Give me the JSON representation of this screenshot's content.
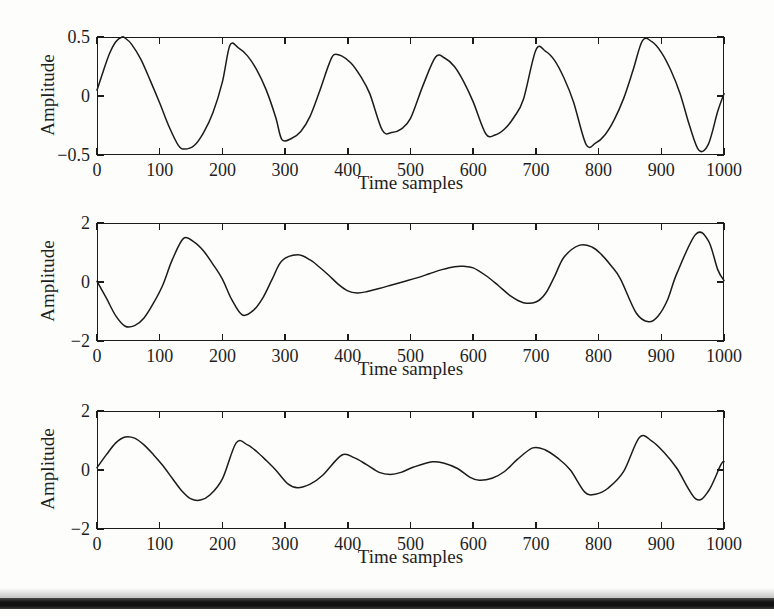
{
  "figure": {
    "background_color": "#fdfdfc",
    "line_color": "#1b1b1b",
    "panel_count": 3
  },
  "axis_labels": {
    "xlabel": "Time samples",
    "ylabel": "Amplitude"
  },
  "xticks": [
    "0",
    "100",
    "200",
    "300",
    "400",
    "500",
    "600",
    "700",
    "800",
    "900",
    "1000"
  ],
  "panels": [
    {
      "name": "panel-top",
      "ylabel": "Amplitude",
      "xlabel": "Time samples",
      "yticks": [
        "0.5",
        "0",
        "-0.5"
      ]
    },
    {
      "name": "panel-middle",
      "ylabel": "Amplitude",
      "xlabel": "Time samples",
      "yticks": [
        "2",
        "0",
        "-2"
      ]
    },
    {
      "name": "panel-bottom",
      "ylabel": "Amplitude",
      "xlabel": "Time samples",
      "yticks": [
        "2",
        "0",
        "-2"
      ]
    }
  ],
  "chart_data": [
    {
      "type": "line",
      "title": "",
      "xlabel": "Time samples",
      "ylabel": "Amplitude",
      "xlim": [
        0,
        1000
      ],
      "ylim": [
        -0.5,
        0.5
      ],
      "xticks": [
        0,
        100,
        200,
        300,
        400,
        500,
        600,
        700,
        800,
        900,
        1000
      ],
      "yticks": [
        -0.5,
        0,
        0.5
      ],
      "grid": false,
      "legend": "none",
      "series": [
        {
          "name": "signal-1",
          "description": "Near-sinusoidal carrier, about 6 cycles over 1000 samples, peak magnitude varying between roughly 0.30 and 0.50",
          "x": [
            0,
            10,
            20,
            30,
            40,
            45,
            55,
            70,
            85,
            100,
            115,
            130,
            140,
            155,
            170,
            185,
            200,
            212,
            225,
            240,
            255,
            270,
            285,
            295,
            310,
            325,
            340,
            355,
            370,
            378,
            390,
            405,
            420,
            435,
            455,
            470,
            485,
            500,
            520,
            540,
            555,
            570,
            585,
            600,
            620,
            635,
            650,
            665,
            680,
            700,
            715,
            730,
            745,
            760,
            780,
            795,
            810,
            825,
            840,
            855,
            870,
            885,
            900,
            915,
            930,
            945,
            960,
            975,
            990,
            1000
          ],
          "y": [
            0.05,
            0.21,
            0.36,
            0.46,
            0.5,
            0.49,
            0.44,
            0.31,
            0.13,
            -0.06,
            -0.26,
            -0.42,
            -0.45,
            -0.42,
            -0.31,
            -0.14,
            0.12,
            0.43,
            0.41,
            0.34,
            0.22,
            0.05,
            -0.18,
            -0.37,
            -0.36,
            -0.3,
            -0.17,
            0.04,
            0.27,
            0.35,
            0.34,
            0.28,
            0.17,
            0.02,
            -0.29,
            -0.31,
            -0.28,
            -0.19,
            0.09,
            0.33,
            0.32,
            0.25,
            0.12,
            -0.05,
            -0.32,
            -0.33,
            -0.28,
            -0.18,
            -0.03,
            0.39,
            0.38,
            0.3,
            0.15,
            -0.05,
            -0.41,
            -0.4,
            -0.33,
            -0.2,
            -0.02,
            0.22,
            0.47,
            0.46,
            0.37,
            0.22,
            0.02,
            -0.25,
            -0.46,
            -0.41,
            -0.13,
            0.02
          ]
        }
      ]
    },
    {
      "type": "line",
      "title": "",
      "xlabel": "Time samples",
      "ylabel": "Amplitude",
      "xlim": [
        0,
        1000
      ],
      "ylim": [
        -2,
        2
      ],
      "xticks": [
        0,
        100,
        200,
        300,
        400,
        500,
        600,
        700,
        800,
        900,
        1000
      ],
      "yticks": [
        -2,
        0,
        2
      ],
      "grid": false,
      "legend": "none",
      "series": [
        {
          "name": "signal-2",
          "description": "Amplitude-modulated waveform; large excursions near the start and end, strongly attenuated region between samples 400 and 620",
          "x": [
            0,
            15,
            30,
            45,
            60,
            75,
            90,
            105,
            120,
            138,
            155,
            170,
            185,
            200,
            215,
            232,
            250,
            265,
            280,
            295,
            320,
            340,
            355,
            370,
            385,
            400,
            415,
            430,
            450,
            470,
            490,
            510,
            530,
            550,
            570,
            585,
            600,
            620,
            640,
            660,
            680,
            700,
            715,
            730,
            745,
            770,
            790,
            805,
            820,
            835,
            860,
            880,
            895,
            910,
            925,
            955,
            975,
            990,
            1000
          ],
          "y": [
            0.02,
            -0.55,
            -1.15,
            -1.5,
            -1.48,
            -1.22,
            -0.72,
            -0.1,
            0.75,
            1.48,
            1.35,
            1.05,
            0.6,
            0.1,
            -0.6,
            -1.12,
            -0.95,
            -0.52,
            0.12,
            0.72,
            0.92,
            0.75,
            0.5,
            0.22,
            -0.08,
            -0.3,
            -0.37,
            -0.33,
            -0.22,
            -0.1,
            0.02,
            0.14,
            0.28,
            0.42,
            0.52,
            0.53,
            0.48,
            0.22,
            -0.12,
            -0.48,
            -0.7,
            -0.68,
            -0.4,
            0.2,
            0.85,
            1.25,
            1.18,
            0.92,
            0.55,
            0.1,
            -1.05,
            -1.35,
            -1.15,
            -0.6,
            0.3,
            1.62,
            1.4,
            0.42,
            0.05
          ]
        }
      ]
    },
    {
      "type": "line",
      "title": "",
      "xlabel": "Time samples",
      "ylabel": "Amplitude",
      "xlim": [
        0,
        1000
      ],
      "ylim": [
        -2,
        2
      ],
      "xticks": [
        0,
        100,
        200,
        300,
        400,
        500,
        600,
        700,
        800,
        900,
        1000
      ],
      "yticks": [
        -2,
        0,
        2
      ],
      "grid": false,
      "legend": "none",
      "series": [
        {
          "name": "signal-3",
          "description": "Amplitude-modulated waveform with about 6 cycles; envelope peaks near 1.1 at the start and end, dipping to roughly 0.3 near the middle",
          "x": [
            0,
            15,
            30,
            45,
            60,
            75,
            90,
            105,
            120,
            135,
            150,
            165,
            180,
            200,
            222,
            240,
            255,
            270,
            285,
            305,
            320,
            340,
            360,
            390,
            410,
            430,
            450,
            468,
            485,
            505,
            535,
            555,
            575,
            595,
            610,
            630,
            650,
            670,
            695,
            715,
            735,
            755,
            778,
            795,
            815,
            840,
            865,
            885,
            905,
            925,
            955,
            975,
            995,
            1000
          ],
          "y": [
            0.08,
            0.52,
            0.92,
            1.12,
            1.08,
            0.85,
            0.52,
            0.15,
            -0.28,
            -0.7,
            -0.98,
            -1.02,
            -0.85,
            -0.3,
            0.92,
            0.85,
            0.62,
            0.32,
            0.0,
            -0.48,
            -0.6,
            -0.48,
            -0.18,
            0.5,
            0.42,
            0.18,
            -0.08,
            -0.15,
            -0.08,
            0.1,
            0.28,
            0.22,
            0.05,
            -0.25,
            -0.35,
            -0.28,
            -0.05,
            0.35,
            0.75,
            0.68,
            0.4,
            0.0,
            -0.75,
            -0.82,
            -0.62,
            -0.05,
            1.1,
            0.98,
            0.58,
            0.05,
            -0.98,
            -0.72,
            0.18,
            0.28
          ]
        }
      ]
    }
  ],
  "artifact": {
    "name": "scan-edge-band",
    "color": "#141414"
  }
}
